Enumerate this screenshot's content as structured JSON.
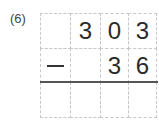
{
  "problem": {
    "number_label": "(6)",
    "operator": "minus",
    "rows": [
      [
        "",
        "3",
        "0",
        "3"
      ],
      [
        "-",
        "",
        "3",
        "6"
      ],
      [
        "",
        "",
        "",
        ""
      ]
    ]
  }
}
